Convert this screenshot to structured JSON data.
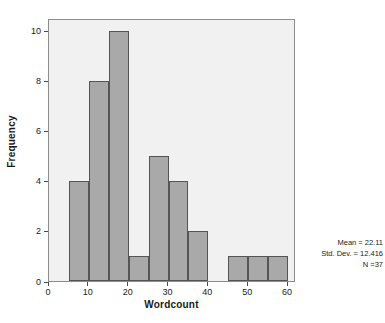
{
  "chart_data": {
    "type": "bar",
    "title": "",
    "xlabel": "Wordcount",
    "ylabel": "Frequency",
    "xlim": [
      0,
      62
    ],
    "ylim": [
      0,
      10.5
    ],
    "grid": false,
    "legend": null,
    "bin_width": 5,
    "categories": [
      "5-10",
      "10-15",
      "15-20",
      "20-25",
      "25-30",
      "30-35",
      "35-40",
      "45-50",
      "50-55",
      "55-60"
    ],
    "bins": [
      {
        "start": 5,
        "end": 10,
        "value": 4
      },
      {
        "start": 10,
        "end": 15,
        "value": 8
      },
      {
        "start": 15,
        "end": 20,
        "value": 10
      },
      {
        "start": 20,
        "end": 25,
        "value": 1
      },
      {
        "start": 25,
        "end": 30,
        "value": 5
      },
      {
        "start": 30,
        "end": 35,
        "value": 4
      },
      {
        "start": 35,
        "end": 40,
        "value": 2
      },
      {
        "start": 45,
        "end": 50,
        "value": 1
      },
      {
        "start": 50,
        "end": 55,
        "value": 1
      },
      {
        "start": 55,
        "end": 60,
        "value": 1
      }
    ],
    "values": [
      4,
      8,
      10,
      1,
      5,
      4,
      2,
      1,
      1,
      1
    ],
    "xticks": [
      0,
      10,
      20,
      30,
      40,
      50,
      60
    ],
    "yticks": [
      0,
      2,
      4,
      6,
      8,
      10
    ],
    "colors": {
      "bar_fill": "#a9a9a9",
      "bar_border": "#555555",
      "plot_background": "#f1f1f1",
      "plot_border": "#8c8c8c",
      "text": "#1a1a1a"
    },
    "annotations": {
      "mean_label": "Mean = 22.11",
      "std_dev_label": "Std. Dev. = 12.416",
      "n_label": "N =37",
      "mean": 22.11,
      "std_dev": 12.416,
      "n": 37
    }
  }
}
